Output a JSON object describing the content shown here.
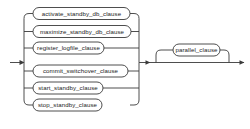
{
  "diagram": {
    "kind": "railroad-syntax-diagram",
    "colors": {
      "background": "#ffffff",
      "line": "#3a3a3a",
      "text": "#1a1a1a"
    },
    "entry": {
      "name": "entry-arrow"
    },
    "exit": {
      "name": "exit-arrow"
    },
    "alternatives": [
      {
        "id": "activate_standby_db_clause",
        "label": "activate_standby_db_clause"
      },
      {
        "id": "maximize_standby_db_clause",
        "label": "maximize_standby_db_clause"
      },
      {
        "id": "register_logfile_clause",
        "label": "register_logfile_clause"
      },
      {
        "id": "commit_switchover_clause",
        "label": "commit_switchover_clause"
      },
      {
        "id": "start_standby_clause",
        "label": "start_standby_clause"
      },
      {
        "id": "stop_standby_clause",
        "label": "stop_standby_clause"
      }
    ],
    "optional": [
      {
        "id": "parallel_clause",
        "label": "parallel_clause"
      }
    ]
  }
}
